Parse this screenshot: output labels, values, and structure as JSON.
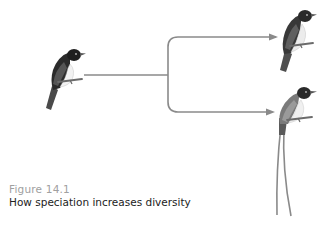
{
  "figure": {
    "label": "Figure 14.1",
    "title": "How speciation increases diversity"
  },
  "diagram": {
    "ancestor": "ancestral-bird",
    "descendants": [
      "descendant-bird-short-tail",
      "descendant-bird-long-tail"
    ],
    "line_color": "#8a8a8a",
    "label_color": "#a0a0a0",
    "title_color": "#222222"
  }
}
